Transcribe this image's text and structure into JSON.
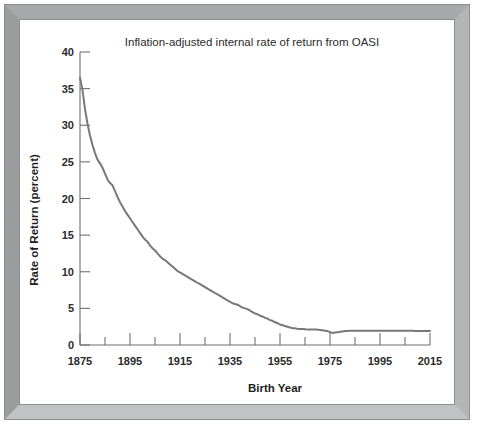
{
  "figure": {
    "frame_color": "#a8a9ab",
    "background": "#ffffff"
  },
  "chart_data": {
    "type": "line",
    "title": "Inflation-adjusted internal rate of return from OASI",
    "xlabel": "Birth Year",
    "ylabel": "Rate of Return (percent)",
    "xlim": [
      1875,
      2015
    ],
    "ylim": [
      0,
      40
    ],
    "grid": false,
    "legend": null,
    "line_color": "#77787a",
    "x_major_ticks": [
      1875,
      1895,
      1915,
      1935,
      1955,
      1975,
      1995,
      2015
    ],
    "x_major_tick_labels": [
      "1875",
      "1895",
      "1915",
      "1935",
      "1955",
      "1975",
      "1995",
      "2015"
    ],
    "x_minor_ticks": [
      1885,
      1905,
      1925,
      1945,
      1965,
      1985,
      2005
    ],
    "y_major_ticks": [
      0,
      5,
      10,
      15,
      20,
      25,
      30,
      35,
      40
    ],
    "y_major_tick_labels": [
      "0",
      "5",
      "10",
      "15",
      "20",
      "25",
      "30",
      "35",
      "40"
    ],
    "series": [
      {
        "name": "Inflation-adjusted internal rate of return from OASI",
        "x": [
          1875,
          1876,
          1877,
          1878,
          1879,
          1880,
          1881,
          1882,
          1883,
          1884,
          1885,
          1886,
          1887,
          1888,
          1889,
          1890,
          1891,
          1892,
          1893,
          1894,
          1895,
          1896,
          1897,
          1898,
          1899,
          1900,
          1901,
          1902,
          1903,
          1904,
          1905,
          1906,
          1907,
          1908,
          1909,
          1910,
          1911,
          1912,
          1913,
          1914,
          1915,
          1916,
          1917,
          1918,
          1919,
          1920,
          1921,
          1922,
          1923,
          1924,
          1925,
          1926,
          1927,
          1928,
          1929,
          1930,
          1931,
          1932,
          1933,
          1934,
          1935,
          1936,
          1937,
          1938,
          1939,
          1940,
          1941,
          1942,
          1943,
          1944,
          1945,
          1946,
          1947,
          1948,
          1949,
          1950,
          1951,
          1952,
          1953,
          1954,
          1955,
          1956,
          1957,
          1958,
          1959,
          1960,
          1961,
          1962,
          1963,
          1964,
          1965,
          1966,
          1967,
          1968,
          1969,
          1970,
          1971,
          1972,
          1973,
          1974,
          1975,
          1976,
          1977,
          1978,
          1979,
          1980,
          1981,
          1982,
          1983,
          1984,
          1985,
          1986,
          1987,
          1988,
          1989,
          1990,
          1991,
          1992,
          1993,
          1994,
          1995,
          1996,
          1997,
          1998,
          1999,
          2000,
          2001,
          2002,
          2003,
          2004,
          2005,
          2006,
          2007,
          2008,
          2009,
          2010,
          2011,
          2012,
          2013,
          2014,
          2015
        ],
        "y": [
          36.5,
          34.8,
          32.2,
          30.2,
          28.6,
          27.3,
          26.2,
          25.3,
          24.8,
          24.2,
          23.4,
          22.6,
          22.1,
          21.8,
          21.0,
          20.2,
          19.5,
          18.9,
          18.3,
          17.8,
          17.3,
          16.8,
          16.3,
          15.8,
          15.3,
          14.8,
          14.4,
          14.1,
          13.6,
          13.2,
          12.9,
          12.5,
          12.1,
          11.8,
          11.6,
          11.3,
          11.0,
          10.7,
          10.4,
          10.1,
          9.9,
          9.7,
          9.5,
          9.3,
          9.1,
          8.9,
          8.7,
          8.5,
          8.3,
          8.1,
          7.9,
          7.7,
          7.5,
          7.3,
          7.1,
          6.9,
          6.7,
          6.5,
          6.3,
          6.1,
          5.9,
          5.7,
          5.6,
          5.5,
          5.3,
          5.1,
          5.0,
          4.9,
          4.7,
          4.5,
          4.3,
          4.2,
          4.0,
          3.9,
          3.7,
          3.6,
          3.4,
          3.3,
          3.1,
          3.0,
          2.8,
          2.7,
          2.6,
          2.5,
          2.4,
          2.3,
          2.3,
          2.2,
          2.2,
          2.2,
          2.15,
          2.1,
          2.1,
          2.1,
          2.1,
          2.1,
          2.05,
          2.0,
          1.95,
          1.9,
          1.75,
          1.65,
          1.7,
          1.75,
          1.8,
          1.85,
          1.9,
          1.92,
          1.95,
          1.95,
          1.95,
          1.95,
          1.95,
          1.95,
          1.95,
          1.95,
          1.95,
          1.95,
          1.95,
          1.95,
          1.95,
          1.95,
          1.95,
          1.95,
          1.95,
          1.95,
          1.95,
          1.95,
          1.95,
          1.95,
          1.95,
          1.95,
          1.95,
          1.95,
          1.9,
          1.9,
          1.9,
          1.9,
          1.9,
          1.9,
          1.9
        ]
      }
    ]
  }
}
